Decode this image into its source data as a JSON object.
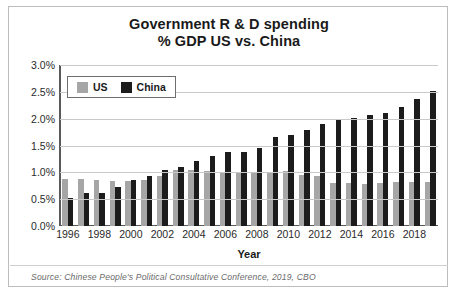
{
  "chart_data": {
    "type": "bar",
    "title": "Government R & D spending % GDP US vs. China",
    "title_line1": "Government R & D spending",
    "title_line2": "% GDP US vs. China",
    "xlabel": "Year",
    "ylabel": "",
    "ylim": [
      0,
      3.0
    ],
    "ytick_labels": [
      "3.0%",
      "2.5%",
      "2.0%",
      "1.5%",
      "1.0%",
      "0.5%",
      "0.0%"
    ],
    "ytick_values": [
      3.0,
      2.5,
      2.0,
      1.5,
      1.0,
      0.5,
      0.0
    ],
    "grid": true,
    "legend_position": "top-left-inside",
    "categories": [
      1996,
      1997,
      1998,
      1999,
      2000,
      2001,
      2002,
      2003,
      2004,
      2005,
      2006,
      2007,
      2008,
      2009,
      2010,
      2011,
      2012,
      2013,
      2014,
      2015,
      2016,
      2017,
      2018,
      2019
    ],
    "xtick_labels": [
      "1996",
      "1998",
      "2000",
      "2002",
      "2004",
      "2006",
      "2008",
      "2010",
      "2012",
      "2014",
      "2016",
      "2018"
    ],
    "series": [
      {
        "name": "US",
        "color": "#a6a6a6",
        "values": [
          0.87,
          0.87,
          0.85,
          0.83,
          0.83,
          0.86,
          0.94,
          1.04,
          1.05,
          1.02,
          1.0,
          1.0,
          0.99,
          1.01,
          1.02,
          0.95,
          0.93,
          0.81,
          0.81,
          0.78,
          0.81,
          0.82,
          0.82,
          0.82
        ]
      },
      {
        "name": "China",
        "color": "#1c1c1c",
        "values": [
          0.53,
          0.61,
          0.61,
          0.72,
          0.85,
          0.93,
          1.05,
          1.1,
          1.21,
          1.3,
          1.38,
          1.38,
          1.46,
          1.66,
          1.7,
          1.78,
          1.91,
          1.98,
          2.01,
          2.06,
          2.1,
          2.21,
          2.37,
          2.51
        ]
      }
    ],
    "source": "Source: Chinese People's Political Consultative Conference, 2019, CBO"
  }
}
